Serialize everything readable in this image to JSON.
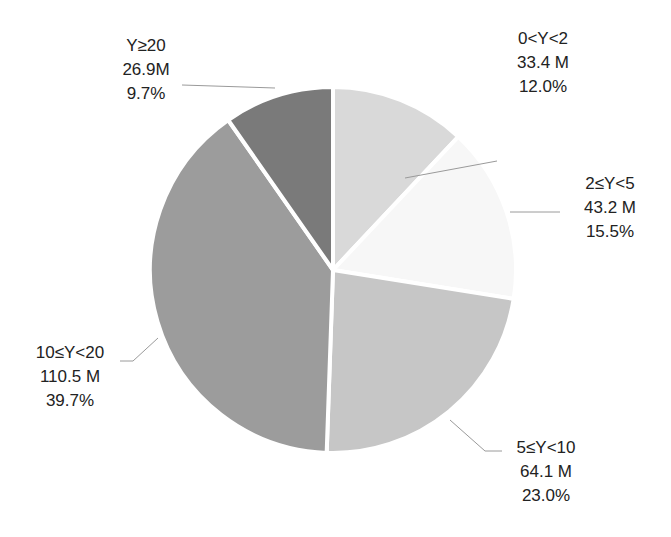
{
  "chart_data": {
    "type": "pie",
    "title": "",
    "categories": [
      "0<Y<2",
      "2≤Y<5",
      "5≤Y<10",
      "10≤Y<20",
      "Y≥20"
    ],
    "values_millions": [
      33.4,
      43.2,
      64.1,
      110.5,
      26.9
    ],
    "value_labels": [
      "33.4 M",
      "43.2 M",
      "64.1 M",
      "110.5 M",
      "26.9M"
    ],
    "percentages": [
      12.0,
      15.5,
      23.0,
      39.7,
      9.7
    ],
    "percent_labels": [
      "12.0%",
      "15.5%",
      "23.0%",
      "39.7%",
      "9.7%"
    ],
    "colors": [
      "#d9d9d9",
      "#f7f7f7",
      "#c6c6c6",
      "#9c9c9c",
      "#7a7a7a"
    ],
    "start_angle_deg": 0,
    "direction": "clockwise",
    "legend": "none",
    "data_labels": "outside with leader lines"
  },
  "labels": [
    {
      "cat": "0<Y<2",
      "val": "33.4 M",
      "pct": "12.0%"
    },
    {
      "cat": "2≤Y<5",
      "val": "43.2 M",
      "pct": "15.5%"
    },
    {
      "cat": "5≤Y<10",
      "val": "64.1 M",
      "pct": "23.0%"
    },
    {
      "cat": "10≤Y<20",
      "val": "110.5 M",
      "pct": "39.7%"
    },
    {
      "cat": "Y≥20",
      "val": "26.9M",
      "pct": "9.7%"
    }
  ]
}
